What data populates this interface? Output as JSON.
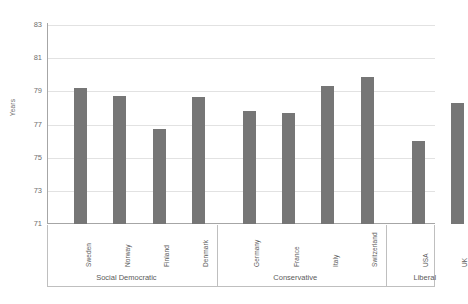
{
  "chart_data": {
    "type": "bar",
    "title": "",
    "xlabel": "",
    "ylabel": "Years",
    "ylim": [
      71,
      83
    ],
    "ytick_values": [
      83,
      81,
      79,
      77,
      75,
      73,
      71
    ],
    "ytick_labels": [
      "83",
      "81",
      "79",
      "77",
      "75",
      "73",
      "71"
    ],
    "grid": true,
    "legend": "none",
    "bar_color": "#767676",
    "gridline_color": "#e2e2e2",
    "axis_color": "#a6a6a6",
    "categories": [
      "Sweden",
      "Norway",
      "Finland",
      "Denmark",
      "Germany",
      "France",
      "Italy",
      "Switzerland",
      "USA",
      "UK"
    ],
    "values": [
      79.2,
      78.7,
      76.75,
      78.65,
      77.8,
      77.7,
      79.3,
      79.85,
      76.0,
      78.3
    ],
    "groups": [
      {
        "label": "Social Democratic",
        "categories": [
          "Sweden",
          "Norway",
          "Finland",
          "Denmark"
        ]
      },
      {
        "label": "Conservative",
        "categories": [
          "Germany",
          "France",
          "Italy",
          "Switzerland"
        ]
      },
      {
        "label": "Liberal",
        "categories": [
          "USA",
          "UK"
        ]
      }
    ]
  },
  "axis": {
    "y_title": "Years"
  },
  "bars": [
    {
      "name": "Sweden",
      "value": 79.2,
      "group": "Social Democratic"
    },
    {
      "name": "Norway",
      "value": 78.7,
      "group": "Social Democratic"
    },
    {
      "name": "Finland",
      "value": 76.75,
      "group": "Social Democratic"
    },
    {
      "name": "Denmark",
      "value": 78.65,
      "group": "Social Democratic"
    },
    {
      "name": "Germany",
      "value": 77.8,
      "group": "Conservative"
    },
    {
      "name": "France",
      "value": 77.7,
      "group": "Conservative"
    },
    {
      "name": "Italy",
      "value": 79.3,
      "group": "Conservative"
    },
    {
      "name": "Switzerland",
      "value": 79.85,
      "group": "Conservative"
    },
    {
      "name": "USA",
      "value": 76.0,
      "group": "Liberal"
    },
    {
      "name": "UK",
      "value": 78.3,
      "group": "Liberal"
    }
  ],
  "group_labels": [
    "Social Democratic",
    "Conservative",
    "Liberal"
  ]
}
